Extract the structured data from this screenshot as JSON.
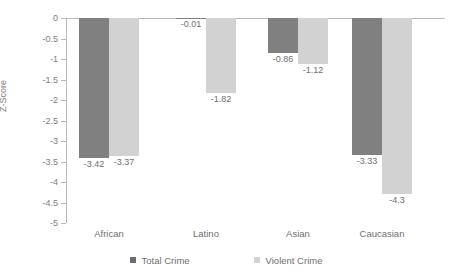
{
  "caption_clipped": "Source: Bureau of Justice Statistics, 2012",
  "chart_data": {
    "type": "bar",
    "title": "",
    "xlabel": "",
    "ylabel": "Z-Score",
    "ylim": [
      -5,
      0
    ],
    "ytick_labels": [
      "0",
      "-0.5",
      "-1",
      "-1.5",
      "-2",
      "-2.5",
      "-3",
      "-3.5",
      "-4",
      "-4.5",
      "-5"
    ],
    "ytick_values": [
      0,
      -0.5,
      -1,
      -1.5,
      -2,
      -2.5,
      -3,
      -3.5,
      -4,
      -4.5,
      -5
    ],
    "categories": [
      "African",
      "Latino",
      "Asian",
      "Caucasian"
    ],
    "grid": false,
    "legend_position": "bottom",
    "series": [
      {
        "name": "Total Crime",
        "color": "#808080",
        "values": [
          -3.42,
          -0.01,
          -0.86,
          -3.33
        ],
        "labels": [
          "-3.42",
          "-0.01",
          "-0.86",
          "-3.33"
        ]
      },
      {
        "name": "Violent Crime",
        "color": "#d2d2d2",
        "values": [
          -3.37,
          -1.82,
          -1.12,
          -4.3
        ],
        "labels": [
          "-3.37",
          "-1.82",
          "-1.12",
          "-4.3"
        ]
      }
    ]
  }
}
